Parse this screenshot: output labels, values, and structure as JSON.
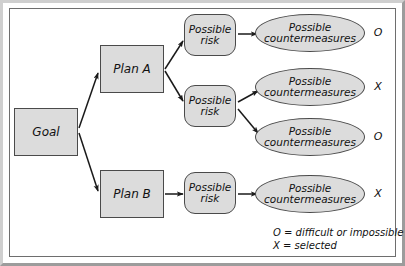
{
  "diagram": {
    "type": "tree-diagram",
    "colors": {
      "node_fill": "#dcdcdc",
      "node_stroke": "#4a4a4a",
      "arrow": "#1a1a1a",
      "frame": "#6e6e6e",
      "text": "#111111"
    },
    "nodes": {
      "goal": {
        "label": "Goal",
        "shape": "rectangle",
        "x": 14,
        "y": 108,
        "w": 64,
        "h": 48
      },
      "plan_a": {
        "label": "Plan A",
        "shape": "rectangle",
        "x": 100,
        "y": 45,
        "w": 64,
        "h": 48
      },
      "plan_b": {
        "label": "Plan B",
        "shape": "rectangle",
        "x": 100,
        "y": 170,
        "w": 64,
        "h": 48
      },
      "risk_1": {
        "label": "Possible risk",
        "shape": "rounded-rectangle",
        "x": 184,
        "y": 14,
        "w": 52,
        "h": 42
      },
      "risk_2": {
        "label": "Possible risk",
        "shape": "rounded-rectangle",
        "x": 184,
        "y": 85,
        "w": 52,
        "h": 42
      },
      "risk_3": {
        "label": "Possible risk",
        "shape": "rounded-rectangle",
        "x": 184,
        "y": 172,
        "w": 52,
        "h": 42
      },
      "cm_1": {
        "label": "Possible countermeasures",
        "shape": "ellipse",
        "x": 255,
        "y": 14,
        "w": 110,
        "h": 38
      },
      "cm_2": {
        "label": "Possible countermeasures",
        "shape": "ellipse",
        "x": 255,
        "y": 68,
        "w": 110,
        "h": 38
      },
      "cm_3": {
        "label": "Possible countermeasures",
        "shape": "ellipse",
        "x": 255,
        "y": 118,
        "w": 110,
        "h": 38
      },
      "cm_4": {
        "label": "Possible countermeasures",
        "shape": "ellipse",
        "x": 255,
        "y": 175,
        "w": 110,
        "h": 38
      }
    },
    "markers": [
      {
        "symbol": "O",
        "for": "cm_1",
        "x": 374,
        "y": 26
      },
      {
        "symbol": "X",
        "for": "cm_2",
        "x": 374,
        "y": 80
      },
      {
        "symbol": "O",
        "for": "cm_3",
        "x": 374,
        "y": 130
      },
      {
        "symbol": "X",
        "for": "cm_4",
        "x": 374,
        "y": 187
      }
    ],
    "edges": [
      {
        "from": "goal",
        "to": "plan_a"
      },
      {
        "from": "goal",
        "to": "plan_b"
      },
      {
        "from": "plan_a",
        "to": "risk_1"
      },
      {
        "from": "plan_a",
        "to": "risk_2"
      },
      {
        "from": "plan_b",
        "to": "risk_3"
      },
      {
        "from": "risk_1",
        "to": "cm_1"
      },
      {
        "from": "risk_2",
        "to": "cm_2"
      },
      {
        "from": "risk_2",
        "to": "cm_3"
      },
      {
        "from": "risk_3",
        "to": "cm_4"
      }
    ],
    "legend": {
      "line_1": "O = difficult or impossible",
      "line_2": "X = selected"
    }
  }
}
